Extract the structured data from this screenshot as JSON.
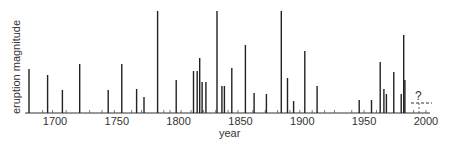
{
  "chart_data": {
    "type": "bar",
    "title": "",
    "xlabel": "year",
    "ylabel": "eruption magnitude",
    "xlim": [
      1675,
      2000
    ],
    "ylim": [
      0,
      102
    ],
    "grid": false,
    "legend": null,
    "x_ticks": [
      1700,
      1750,
      1800,
      1850,
      1900,
      1950,
      2000
    ],
    "x_tick_labels": [
      "1700",
      "1750",
      "1800",
      "1850",
      "1900",
      "1950",
      "2000"
    ],
    "bar_color": "#222222",
    "x": [
      1679,
      1694,
      1706,
      1720,
      1743,
      1754,
      1766,
      1772,
      1783,
      1798,
      1812,
      1815,
      1817,
      1819,
      1822,
      1831,
      1835,
      1837,
      1843,
      1854,
      1861,
      1871,
      1883,
      1888,
      1893,
      1902,
      1912,
      1946,
      1956,
      1963,
      1966,
      1968,
      1974,
      1980,
      1982,
      1983
    ],
    "values": [
      44,
      38,
      23,
      49,
      23,
      49,
      24,
      16,
      102,
      33,
      42,
      42,
      55,
      31,
      31,
      102,
      27,
      27,
      45,
      68,
      20,
      19,
      102,
      35,
      12,
      62,
      27,
      13,
      13,
      51,
      24,
      19,
      41,
      19,
      78,
      33
    ],
    "minor_ticks": [
      1690,
      1698,
      1709,
      1728,
      1738,
      1748,
      1762,
      1770,
      1788,
      1793,
      1802,
      1810,
      1820,
      1830,
      1840,
      1848,
      1860,
      1870,
      1880,
      1890,
      1898,
      1908,
      1918,
      1926,
      1940,
      1950,
      1960,
      1990,
      2000
    ],
    "annotations": [
      {
        "text": "?",
        "x": 1992,
        "y": 10,
        "note": "dashed line indicating unknown future eruption magnitude"
      }
    ]
  },
  "axis": {
    "ylabel": "eruption magnitude",
    "xlabel": "year",
    "question_mark": "?"
  }
}
